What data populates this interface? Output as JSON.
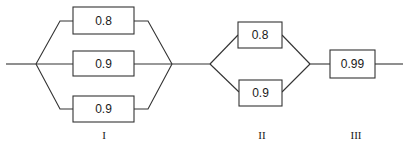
{
  "diagram": {
    "type": "reliability-block-diagram",
    "stages": [
      {
        "label": "I",
        "configuration": "parallel",
        "components": [
          {
            "reliability": "0.8"
          },
          {
            "reliability": "0.9"
          },
          {
            "reliability": "0.9"
          }
        ]
      },
      {
        "label": "II",
        "configuration": "parallel",
        "components": [
          {
            "reliability": "0.8"
          },
          {
            "reliability": "0.9"
          }
        ]
      },
      {
        "label": "III",
        "configuration": "series",
        "components": [
          {
            "reliability": "0.99"
          }
        ]
      }
    ],
    "colors": {
      "line": "#333333",
      "text": "#1a1a1a",
      "background": "#ffffff"
    }
  }
}
